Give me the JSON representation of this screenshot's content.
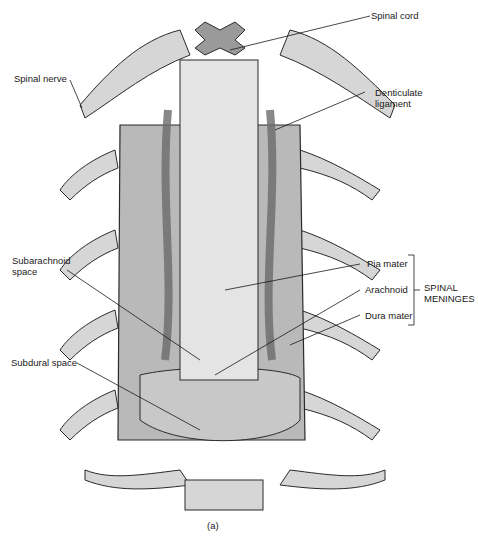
{
  "figure": {
    "caption": "(a)",
    "colors": {
      "dura": "#b9b9b9",
      "cord": "#e4e4e4",
      "nerve": "#d6d6d6",
      "outline": "#2a2a2a",
      "vessel": "#8a8a8a"
    }
  },
  "labels": {
    "spinal_cord": "Spinal cord",
    "spinal_nerve": "Spinal nerve",
    "denticulate_ligament": "Denticulate\nligament",
    "subarachnoid_space": "Subarachnoid\nspace",
    "pia_mater": "Pia mater",
    "arachnoid": "Arachnoid",
    "dura_mater": "Dura mater",
    "subdural_space": "Subdural space",
    "spinal_meninges": "SPINAL\nMENINGES"
  }
}
